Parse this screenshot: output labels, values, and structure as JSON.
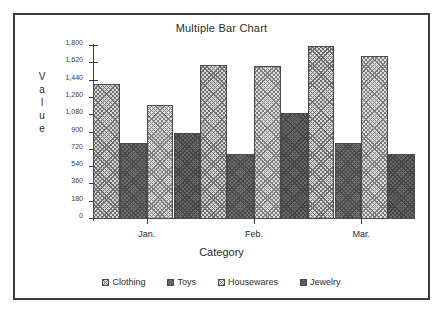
{
  "chart_data": {
    "type": "bar",
    "title": "Multiple Bar Chart",
    "xlabel": "Category",
    "ylabel": "Value",
    "categories": [
      "Jan.",
      "Feb.",
      "Mar."
    ],
    "series": [
      {
        "name": "Clothing",
        "values": [
          1400,
          1600,
          1800
        ]
      },
      {
        "name": "Toys",
        "values": [
          790,
          680,
          790
        ]
      },
      {
        "name": "Housewares",
        "values": [
          1190,
          1595,
          1700
        ]
      },
      {
        "name": "Jewelry",
        "values": [
          900,
          1100,
          680
        ]
      }
    ],
    "ylim": [
      0,
      1800
    ],
    "ytick_step": 180,
    "ytick_labels": [
      "0",
      "180",
      "360",
      "540",
      "720",
      "900",
      "1,080",
      "1,260",
      "1,440",
      "1,620",
      "1,800"
    ],
    "ytick_values": [
      0,
      180,
      360,
      540,
      720,
      900,
      1080,
      1260,
      1440,
      1620,
      1800
    ],
    "grid": false,
    "legend_position": "bottom",
    "series_fill_classes": [
      "fill-clothing",
      "fill-toys",
      "fill-housewares",
      "fill-jewelry"
    ]
  },
  "frame": {
    "border_color": "#3c3c3c",
    "background": "#ffffff"
  }
}
